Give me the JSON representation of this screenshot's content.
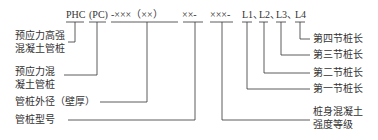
{
  "code": {
    "phc": "PHC",
    "pc": "(PC)",
    "diameter": "-×××（××）",
    "type": "××-",
    "grade": "×××-",
    "l1": "L1、",
    "l2": "L2、",
    "l3": "L3、",
    "l4": "L4"
  },
  "labels": {
    "phc": [
      "预应力高强",
      "混凝土管桩"
    ],
    "pc": [
      "预应力混",
      "凝土管桩"
    ],
    "diameter": "管桩外径（壁厚）",
    "type": "管桩型号",
    "l4": "第四节桩长",
    "l3": "第三节桩长",
    "l2": "第二节桩长",
    "l1": "第一节桩长",
    "grade": [
      "桩身混凝土",
      "强度等级"
    ]
  }
}
